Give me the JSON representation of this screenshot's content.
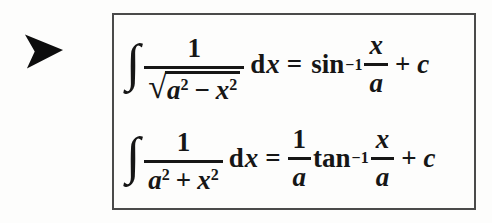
{
  "colors": {
    "background": "#fdfdfc",
    "text": "#161616",
    "box_border": "#4a4a4a",
    "arrow_fill": "#0d0d0d"
  },
  "pointer": {
    "icon": "right-arrowhead"
  },
  "panel": {
    "formulas": [
      {
        "integral": "∫",
        "numerator": "1",
        "radical_sign": "√",
        "radicand": {
          "base1": "a",
          "exp1": "2",
          "operator": "−",
          "base2": "x",
          "exp2": "2"
        },
        "differential_d": "d",
        "differential_var": "x",
        "equals": "=",
        "function_name": "sin",
        "function_exponent": "−1",
        "argument_numerator": "x",
        "argument_denominator": "a",
        "plus": "+",
        "constant": "c"
      },
      {
        "integral": "∫",
        "numerator": "1",
        "denominator": {
          "base1": "a",
          "exp1": "2",
          "operator": "+",
          "base2": "x",
          "exp2": "2"
        },
        "differential_d": "d",
        "differential_var": "x",
        "equals": "=",
        "coefficient_numerator": "1",
        "coefficient_denominator": "a",
        "function_name": "tan",
        "function_exponent": "−1",
        "argument_numerator": "x",
        "argument_denominator": "a",
        "plus": "+",
        "constant": "c"
      }
    ]
  }
}
